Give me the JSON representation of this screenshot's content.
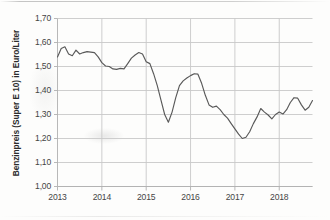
{
  "chart_data": {
    "type": "line",
    "title": "",
    "subtitle": "",
    "xlabel": "",
    "ylabel": "Benzinpreis (Super E 10) in Euro/Liter",
    "ylim": [
      1.0,
      1.7
    ],
    "xlim": [
      "2013",
      "2018-10"
    ],
    "ytick_labels": [
      "1,70",
      "1,60",
      "1,50",
      "1,40",
      "1,30",
      "1,20",
      "1,10",
      "1,00"
    ],
    "ytick_values": [
      1.7,
      1.6,
      1.5,
      1.4,
      1.3,
      1.2,
      1.1,
      1.0
    ],
    "xtick_labels": [
      "2013",
      "2014",
      "2015",
      "2016",
      "2017",
      "2018"
    ],
    "xtick_values": [
      2013,
      2014,
      2015,
      2016,
      2017,
      2018
    ],
    "grid": true,
    "grid_axis": "both",
    "legend": false,
    "legend_position": "none",
    "line_color": "#595959",
    "background_color": "#ffffff",
    "axis_color": "#b0b0b0",
    "grid_color": "#c8c8c8",
    "series": [
      {
        "name": "Benzinpreis Super E 10",
        "unit": "Euro/Liter",
        "x": [
          "2013-01",
          "2013-02",
          "2013-03",
          "2013-04",
          "2013-05",
          "2013-06",
          "2013-07",
          "2013-08",
          "2013-09",
          "2013-10",
          "2013-11",
          "2013-12",
          "2014-01",
          "2014-02",
          "2014-03",
          "2014-04",
          "2014-05",
          "2014-06",
          "2014-07",
          "2014-08",
          "2014-09",
          "2014-10",
          "2014-11",
          "2014-12",
          "2015-01",
          "2015-02",
          "2015-03",
          "2015-04",
          "2015-05",
          "2015-06",
          "2015-07",
          "2015-08",
          "2015-09",
          "2015-10",
          "2015-11",
          "2015-12",
          "2016-01",
          "2016-02",
          "2016-03",
          "2016-04",
          "2016-05",
          "2016-06",
          "2016-07",
          "2016-08",
          "2016-09",
          "2016-10",
          "2016-11",
          "2016-12",
          "2017-01",
          "2017-02",
          "2017-03",
          "2017-04",
          "2017-05",
          "2017-06",
          "2017-07",
          "2017-08",
          "2017-09",
          "2017-10",
          "2017-11",
          "2017-12",
          "2018-01",
          "2018-02",
          "2018-03",
          "2018-04",
          "2018-05",
          "2018-06",
          "2018-07",
          "2018-08",
          "2018-09",
          "2018-10"
        ],
        "values": [
          1.54,
          1.575,
          1.582,
          1.552,
          1.545,
          1.568,
          1.552,
          1.558,
          1.562,
          1.56,
          1.558,
          1.54,
          1.516,
          1.502,
          1.5,
          1.49,
          1.488,
          1.492,
          1.49,
          1.512,
          1.535,
          1.548,
          1.558,
          1.552,
          1.52,
          1.512,
          1.47,
          1.42,
          1.36,
          1.3,
          1.268,
          1.31,
          1.37,
          1.42,
          1.44,
          1.452,
          1.462,
          1.47,
          1.468,
          1.43,
          1.38,
          1.34,
          1.33,
          1.335,
          1.32,
          1.3,
          1.285,
          1.262,
          1.24,
          1.218,
          1.2,
          1.205,
          1.228,
          1.262,
          1.29,
          1.325,
          1.31,
          1.298,
          1.282,
          1.3,
          1.31,
          1.302,
          1.32,
          1.35,
          1.37,
          1.368,
          1.34,
          1.318,
          1.33,
          1.358
        ]
      }
    ],
    "annotations": []
  }
}
